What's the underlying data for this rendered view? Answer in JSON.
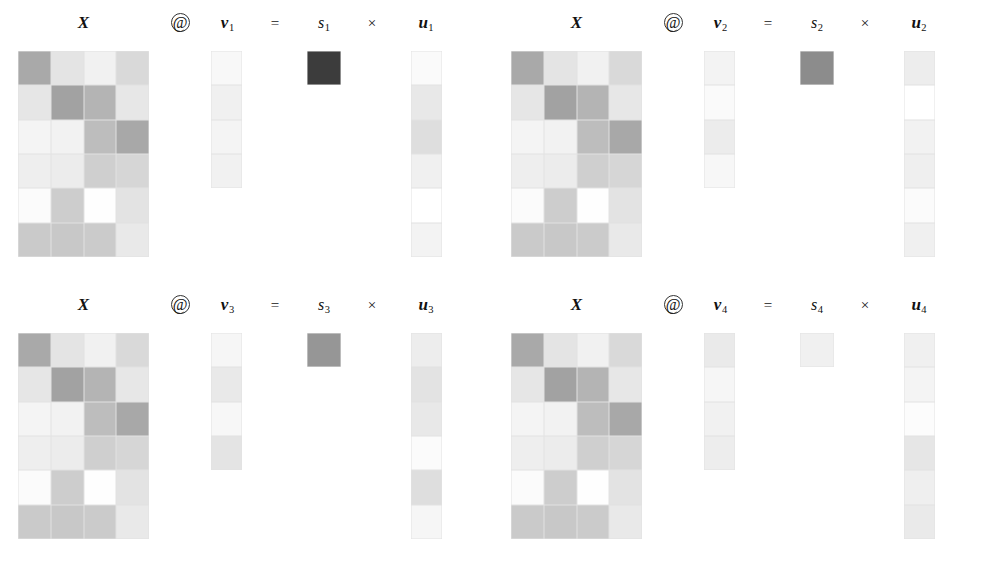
{
  "figure": {
    "rows_X": 6,
    "cols_X": 4,
    "rows_u": 6,
    "rows_v": 4
  },
  "symbols": {
    "matmul": "@",
    "equals": "=",
    "times": "×",
    "matrix_label": "X",
    "v_label": "v",
    "s_label": "s",
    "u_label": "u"
  },
  "colors": {
    "background": "#ffffff",
    "darkest": "#3c3c3c",
    "lightest": "#ffffff",
    "grid_line": "#e2e2e2"
  },
  "chart_data": {
    "type": "heatmap",
    "grid": true,
    "legend": "none",
    "colormap": "greys",
    "value_range": [
      0,
      1
    ],
    "panels": [
      {
        "index": 1,
        "equation": "X @ v1 = s1 × u1",
        "labels": {
          "matrix": "X",
          "matmul": "@",
          "v": "v",
          "v_sub": "1",
          "equals": "=",
          "s": "s",
          "s_sub": "1",
          "times": "×",
          "u": "u",
          "u_sub": "1"
        },
        "X": [
          [
            "#a9a9a9",
            "#e4e4e4",
            "#f1f1f1",
            "#d9d9d9"
          ],
          [
            "#e6e6e6",
            "#a2a2a2",
            "#b4b4b4",
            "#e7e7e7"
          ],
          [
            "#f4f4f4",
            "#f2f2f2",
            "#bdbdbd",
            "#a8a8a8"
          ],
          [
            "#eeeeee",
            "#ececec",
            "#cfcfcf",
            "#d6d6d6"
          ],
          [
            "#fbfbfb",
            "#cdcdcd",
            "#fefefe",
            "#e3e3e3"
          ],
          [
            "#cacaca",
            "#c8c8c8",
            "#cbcbcb",
            "#e9e9e9"
          ]
        ],
        "v": [
          "#f8f8f8",
          "#f0f0f0",
          "#f4f4f4",
          "#f1f1f1"
        ],
        "s": "#3c3c3c",
        "u": [
          "#fafafa",
          "#e8e8e8",
          "#dedede",
          "#f0f0f0",
          "#ffffff",
          "#f3f3f3"
        ]
      },
      {
        "index": 2,
        "equation": "X @ v2 = s2 × u2",
        "labels": {
          "matrix": "X",
          "matmul": "@",
          "v": "v",
          "v_sub": "2",
          "equals": "=",
          "s": "s",
          "s_sub": "2",
          "times": "×",
          "u": "u",
          "u_sub": "2"
        },
        "X": [
          [
            "#a9a9a9",
            "#e4e4e4",
            "#f1f1f1",
            "#d9d9d9"
          ],
          [
            "#e6e6e6",
            "#a2a2a2",
            "#b4b4b4",
            "#e7e7e7"
          ],
          [
            "#f4f4f4",
            "#f2f2f2",
            "#bdbdbd",
            "#a8a8a8"
          ],
          [
            "#eeeeee",
            "#ececec",
            "#cfcfcf",
            "#d6d6d6"
          ],
          [
            "#fbfbfb",
            "#cdcdcd",
            "#fefefe",
            "#e3e3e3"
          ],
          [
            "#cacaca",
            "#c8c8c8",
            "#cbcbcb",
            "#e9e9e9"
          ]
        ],
        "v": [
          "#f3f3f3",
          "#fafafa",
          "#ececec",
          "#f7f7f7"
        ],
        "s": "#8c8c8c",
        "u": [
          "#ededed",
          "#ffffff",
          "#f2f2f2",
          "#efefef",
          "#fbfbfb",
          "#f0f0f0"
        ]
      },
      {
        "index": 3,
        "equation": "X @ v3 = s3 × u3",
        "labels": {
          "matrix": "X",
          "matmul": "@",
          "v": "v",
          "v_sub": "3",
          "equals": "=",
          "s": "s",
          "s_sub": "3",
          "times": "×",
          "u": "u",
          "u_sub": "3"
        },
        "X": [
          [
            "#a9a9a9",
            "#e4e4e4",
            "#f1f1f1",
            "#d9d9d9"
          ],
          [
            "#e6e6e6",
            "#a2a2a2",
            "#b4b4b4",
            "#e7e7e7"
          ],
          [
            "#f4f4f4",
            "#f2f2f2",
            "#bdbdbd",
            "#a8a8a8"
          ],
          [
            "#eeeeee",
            "#ececec",
            "#cfcfcf",
            "#d6d6d6"
          ],
          [
            "#fbfbfb",
            "#cdcdcd",
            "#fefefe",
            "#e3e3e3"
          ],
          [
            "#cacaca",
            "#c8c8c8",
            "#cbcbcb",
            "#e9e9e9"
          ]
        ],
        "v": [
          "#f6f6f6",
          "#e9e9e9",
          "#f7f7f7",
          "#e4e4e4"
        ],
        "s": "#969696",
        "u": [
          "#ededed",
          "#e3e3e3",
          "#e8e8e8",
          "#fbfbfb",
          "#dedede",
          "#f6f6f6"
        ]
      },
      {
        "index": 4,
        "equation": "X @ v4 = s4 × u4",
        "labels": {
          "matrix": "X",
          "matmul": "@",
          "v": "v",
          "v_sub": "4",
          "equals": "=",
          "s": "s",
          "s_sub": "4",
          "times": "×",
          "u": "u",
          "u_sub": "4"
        },
        "X": [
          [
            "#a9a9a9",
            "#e4e4e4",
            "#f1f1f1",
            "#d9d9d9"
          ],
          [
            "#e6e6e6",
            "#a2a2a2",
            "#b4b4b4",
            "#e7e7e7"
          ],
          [
            "#f4f4f4",
            "#f2f2f2",
            "#bdbdbd",
            "#a8a8a8"
          ],
          [
            "#eeeeee",
            "#ececec",
            "#cfcfcf",
            "#d6d6d6"
          ],
          [
            "#fbfbfb",
            "#cdcdcd",
            "#fefefe",
            "#e3e3e3"
          ],
          [
            "#cacaca",
            "#c8c8c8",
            "#cbcbcb",
            "#e9e9e9"
          ]
        ],
        "v": [
          "#eaeaea",
          "#f6f6f6",
          "#f1f1f1",
          "#ededed"
        ],
        "s": "#f0f0f0",
        "u": [
          "#f0f0f0",
          "#f4f4f4",
          "#fcfcfc",
          "#e6e6e6",
          "#efefef",
          "#eaeaea"
        ]
      }
    ]
  }
}
